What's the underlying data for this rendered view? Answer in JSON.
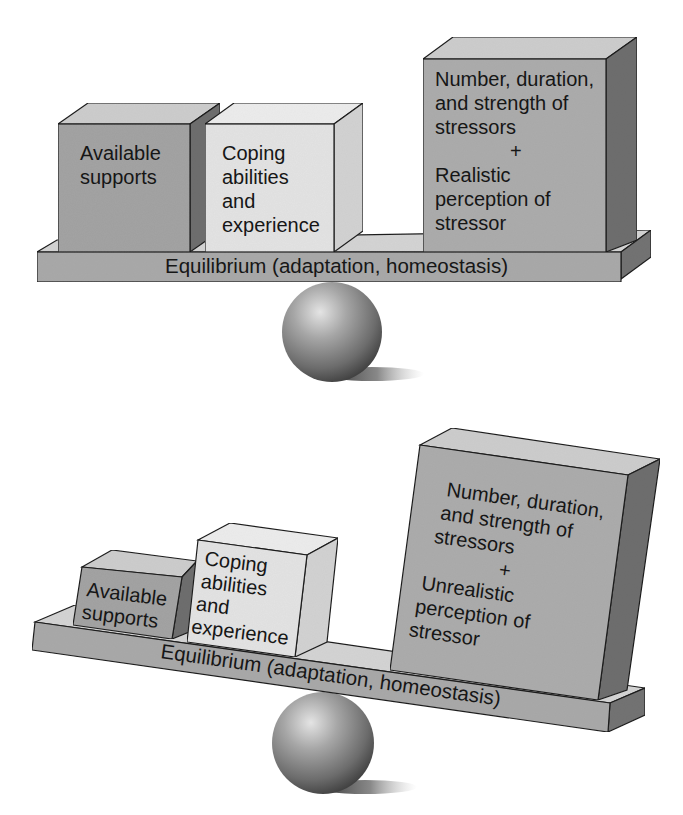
{
  "figure": {
    "colors": {
      "background": "#ffffff",
      "outline": "#1e1e1e",
      "support_box_front": "#a3a3a3",
      "coping_box_front": "#e3e3e3",
      "stressor_box_front": "#acacac",
      "top_face": "#cdcdcd",
      "coping_top_face": "#ececec",
      "side_face_dark": "#6e6e6e",
      "coping_side_face": "#d2d2d2",
      "plank_front": "#a9a9a9",
      "plank_top": "#d4d4d4",
      "plank_side": "#737373",
      "sphere_highlight": "#e2e2e2",
      "sphere_shadow": "#3a3a3a"
    }
  },
  "panels": [
    {
      "id": "balanced",
      "state": "Equilibrium maintained",
      "plank_label": "Equilibrium (adaptation, homeostasis)",
      "left_side": {
        "support_box": {
          "lines": [
            "Available",
            "supports"
          ]
        },
        "coping_box": {
          "lines": [
            "Coping",
            "abilities",
            "and",
            "experience"
          ]
        }
      },
      "right_side": {
        "stressor_box": {
          "lines": [
            "Number, duration,",
            "and strength of",
            "stressors"
          ],
          "plus": "+",
          "perception_lines": [
            "Realistic",
            "perception of",
            "stressor"
          ]
        }
      }
    },
    {
      "id": "imbalanced",
      "state": "Equilibrium lost (tilted)",
      "plank_label": "Equilibrium (adaptation, homeostasis)",
      "left_side": {
        "support_box": {
          "lines": [
            "Available",
            "supports"
          ]
        },
        "coping_box": {
          "lines": [
            "Coping",
            "abilities",
            "and",
            "experience"
          ]
        }
      },
      "right_side": {
        "stressor_box": {
          "lines": [
            "Number, duration,",
            "and strength of",
            "stressors"
          ],
          "plus": "+",
          "perception_lines": [
            "Unrealistic",
            "perception of",
            "stressor"
          ]
        }
      }
    }
  ]
}
